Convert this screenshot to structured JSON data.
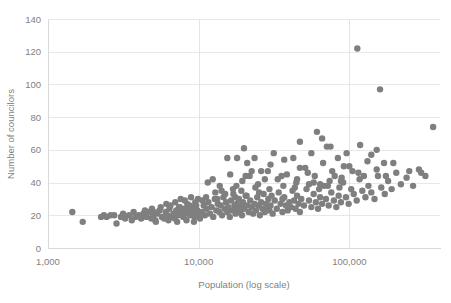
{
  "chart_data": {
    "type": "scatter",
    "title": "",
    "xlabel": "Population (log scale)",
    "ylabel": "Number of councilors",
    "xscale": "log",
    "xlim": [
      1000,
      400000
    ],
    "ylim": [
      0,
      140
    ],
    "xticks": [
      1000,
      10000,
      100000
    ],
    "xtick_labels": [
      "1,000",
      "10,000",
      "100,000"
    ],
    "yticks": [
      0,
      20,
      40,
      60,
      80,
      100,
      120,
      140
    ],
    "ytick_labels": [
      "0",
      "20",
      "40",
      "60",
      "80",
      "100",
      "120",
      "140"
    ],
    "grid": true,
    "legend": false,
    "marker": {
      "color": "#7f7f7f",
      "size": 3.2,
      "shape": "circle"
    },
    "series": [
      {
        "name": "Municipalities",
        "points": [
          [
            1450,
            22
          ],
          [
            1700,
            16
          ],
          [
            2250,
            19
          ],
          [
            2450,
            19
          ],
          [
            2600,
            20
          ],
          [
            2850,
            15
          ],
          [
            3050,
            19
          ],
          [
            3250,
            18
          ],
          [
            3450,
            20
          ],
          [
            3600,
            17
          ],
          [
            3800,
            19
          ],
          [
            4000,
            20
          ],
          [
            4150,
            18
          ],
          [
            4300,
            21
          ],
          [
            4500,
            19
          ],
          [
            4700,
            22
          ],
          [
            4850,
            18
          ],
          [
            5000,
            20
          ],
          [
            5150,
            17
          ],
          [
            5300,
            21
          ],
          [
            5500,
            23
          ],
          [
            5700,
            19
          ],
          [
            5900,
            18
          ],
          [
            6050,
            22
          ],
          [
            6200,
            20
          ],
          [
            6400,
            24
          ],
          [
            6600,
            19
          ],
          [
            6800,
            21
          ],
          [
            6950,
            18
          ],
          [
            7100,
            23
          ],
          [
            7300,
            20
          ],
          [
            7500,
            25
          ],
          [
            7700,
            22
          ],
          [
            7900,
            19
          ],
          [
            8050,
            24
          ],
          [
            8200,
            21
          ],
          [
            8400,
            27
          ],
          [
            8600,
            23
          ],
          [
            8800,
            20
          ],
          [
            9000,
            25
          ],
          [
            9200,
            22
          ],
          [
            9400,
            19
          ],
          [
            9600,
            26
          ],
          [
            9800,
            23
          ],
          [
            10000,
            21
          ],
          [
            6100,
            27
          ],
          [
            6500,
            26
          ],
          [
            7000,
            28
          ],
          [
            7400,
            25
          ],
          [
            8100,
            29
          ],
          [
            8700,
            26
          ],
          [
            9100,
            24
          ],
          [
            9500,
            28
          ],
          [
            5600,
            25
          ],
          [
            4900,
            24
          ],
          [
            5200,
            16
          ],
          [
            6300,
            17
          ],
          [
            7200,
            16
          ],
          [
            8300,
            17
          ],
          [
            9300,
            16
          ],
          [
            10200,
            18
          ],
          [
            10500,
            22
          ],
          [
            10800,
            26
          ],
          [
            11000,
            20
          ],
          [
            11300,
            24
          ],
          [
            11600,
            28
          ],
          [
            11900,
            21
          ],
          [
            12200,
            25
          ],
          [
            12500,
            19
          ],
          [
            12800,
            30
          ],
          [
            13100,
            23
          ],
          [
            13400,
            27
          ],
          [
            13700,
            22
          ],
          [
            14000,
            26
          ],
          [
            14300,
            20
          ],
          [
            14600,
            31
          ],
          [
            14900,
            24
          ],
          [
            15200,
            28
          ],
          [
            15500,
            22
          ],
          [
            15800,
            25
          ],
          [
            16100,
            19
          ],
          [
            16400,
            29
          ],
          [
            16700,
            23
          ],
          [
            17000,
            33
          ],
          [
            17300,
            26
          ],
          [
            17600,
            21
          ],
          [
            17900,
            27
          ],
          [
            18200,
            24
          ],
          [
            18500,
            30
          ],
          [
            18800,
            22
          ],
          [
            19100,
            26
          ],
          [
            19400,
            20
          ],
          [
            19700,
            28
          ],
          [
            20000,
            24
          ],
          [
            20500,
            32
          ],
          [
            21000,
            26
          ],
          [
            21500,
            22
          ],
          [
            22000,
            29
          ],
          [
            22500,
            25
          ],
          [
            23000,
            21
          ],
          [
            23500,
            27
          ],
          [
            24000,
            23
          ],
          [
            24500,
            31
          ],
          [
            25000,
            26
          ],
          [
            25500,
            20
          ],
          [
            26000,
            28
          ],
          [
            26500,
            24
          ],
          [
            27000,
            33
          ],
          [
            27500,
            22
          ],
          [
            28000,
            27
          ],
          [
            28500,
            25
          ],
          [
            29000,
            30
          ],
          [
            29500,
            23
          ],
          [
            30000,
            26
          ],
          [
            31000,
            21
          ],
          [
            32000,
            29
          ],
          [
            33000,
            24
          ],
          [
            34000,
            34
          ],
          [
            35000,
            27
          ],
          [
            36000,
            22
          ],
          [
            37000,
            31
          ],
          [
            38000,
            26
          ],
          [
            39000,
            23
          ],
          [
            40000,
            28
          ],
          [
            41000,
            25
          ],
          [
            42000,
            35
          ],
          [
            43000,
            29
          ],
          [
            44000,
            24
          ],
          [
            45000,
            32
          ],
          [
            46000,
            27
          ],
          [
            47000,
            22
          ],
          [
            48000,
            30
          ],
          [
            50000,
            26
          ],
          [
            52000,
            36
          ],
          [
            54000,
            29
          ],
          [
            56000,
            25
          ],
          [
            58000,
            33
          ],
          [
            60000,
            28
          ],
          [
            62000,
            24
          ],
          [
            64000,
            31
          ],
          [
            66000,
            27
          ],
          [
            68000,
            38
          ],
          [
            70000,
            30
          ],
          [
            73000,
            26
          ],
          [
            76000,
            34
          ],
          [
            79000,
            29
          ],
          [
            82000,
            25
          ],
          [
            85000,
            32
          ],
          [
            88000,
            28
          ],
          [
            91000,
            40
          ],
          [
            95000,
            31
          ],
          [
            99000,
            27
          ],
          [
            103000,
            36
          ],
          [
            107000,
            33
          ],
          [
            112000,
            29
          ],
          [
            117000,
            42
          ],
          [
            122000,
            35
          ],
          [
            128000,
            31
          ],
          [
            134000,
            38
          ],
          [
            140000,
            34
          ],
          [
            147000,
            30
          ],
          [
            155000,
            44
          ],
          [
            163000,
            37
          ],
          [
            172000,
            33
          ],
          [
            181000,
            41
          ],
          [
            191000,
            36
          ],
          [
            205000,
            46
          ],
          [
            220000,
            39
          ],
          [
            240000,
            43
          ],
          [
            265000,
            38
          ],
          [
            290000,
            48
          ],
          [
            320000,
            44
          ],
          [
            360000,
            74
          ],
          [
            11500,
            40
          ],
          [
            12400,
            42
          ],
          [
            13800,
            38
          ],
          [
            16200,
            45
          ],
          [
            17800,
            38
          ],
          [
            19500,
            41
          ],
          [
            21800,
            44
          ],
          [
            24800,
            39
          ],
          [
            28800,
            47
          ],
          [
            33500,
            42
          ],
          [
            38500,
            45
          ],
          [
            44500,
            40
          ],
          [
            51000,
            49
          ],
          [
            59000,
            44
          ],
          [
            67000,
            52
          ],
          [
            77000,
            47
          ],
          [
            89000,
            43
          ],
          [
            100000,
            50
          ],
          [
            115000,
            46
          ],
          [
            132000,
            53
          ],
          [
            152000,
            48
          ],
          [
            175000,
            44
          ],
          [
            21000,
            52
          ],
          [
            30000,
            51
          ],
          [
            42500,
            55
          ],
          [
            56000,
            58
          ],
          [
            66000,
            67
          ],
          [
            71000,
            62
          ],
          [
            75000,
            62
          ],
          [
            61000,
            71
          ],
          [
            47000,
            65
          ],
          [
            37000,
            54
          ],
          [
            26000,
            47
          ],
          [
            22500,
            47
          ],
          [
            20500,
            44
          ],
          [
            15500,
            55
          ],
          [
            18000,
            55
          ],
          [
            23500,
            55
          ],
          [
            31500,
            58
          ],
          [
            20000,
            61
          ],
          [
            113000,
            122
          ],
          [
            160000,
            97
          ],
          [
            152000,
            60
          ],
          [
            140000,
            57
          ],
          [
            170000,
            52
          ],
          [
            196000,
            52
          ],
          [
            250000,
            47
          ],
          [
            300000,
            46
          ],
          [
            118000,
            63
          ],
          [
            96000,
            58
          ],
          [
            84000,
            55
          ],
          [
            92000,
            50
          ],
          [
            47000,
            49
          ],
          [
            53000,
            46
          ],
          [
            35500,
            44
          ],
          [
            27500,
            42
          ],
          [
            45000,
            42
          ],
          [
            58000,
            40
          ],
          [
            64000,
            39
          ],
          [
            72000,
            38
          ],
          [
            80000,
            44
          ],
          [
            88000,
            41
          ],
          [
            105000,
            47
          ],
          [
            125000,
            44
          ],
          [
            14200,
            35
          ],
          [
            12900,
            34
          ],
          [
            16900,
            36
          ],
          [
            19200,
            35
          ],
          [
            23800,
            37
          ],
          [
            29500,
            36
          ],
          [
            36500,
            38
          ],
          [
            43500,
            37
          ],
          [
            54000,
            39
          ],
          [
            63000,
            36
          ],
          [
            74000,
            41
          ],
          [
            86000,
            37
          ],
          [
            11200,
            31
          ],
          [
            13300,
            30
          ],
          [
            15000,
            33
          ],
          [
            17500,
            31
          ],
          [
            20800,
            32
          ],
          [
            25200,
            34
          ],
          [
            30500,
            32
          ],
          [
            36000,
            30
          ],
          [
            4400,
            23
          ],
          [
            5050,
            22
          ],
          [
            3700,
            22
          ],
          [
            3150,
            21
          ],
          [
            2750,
            20
          ],
          [
            2350,
            20
          ],
          [
            9900,
            30
          ],
          [
            10600,
            29
          ],
          [
            8900,
            31
          ],
          [
            7600,
            30
          ]
        ]
      }
    ]
  },
  "axis": {
    "y_title": "Number of councilors",
    "x_title": "Population (log scale)"
  }
}
